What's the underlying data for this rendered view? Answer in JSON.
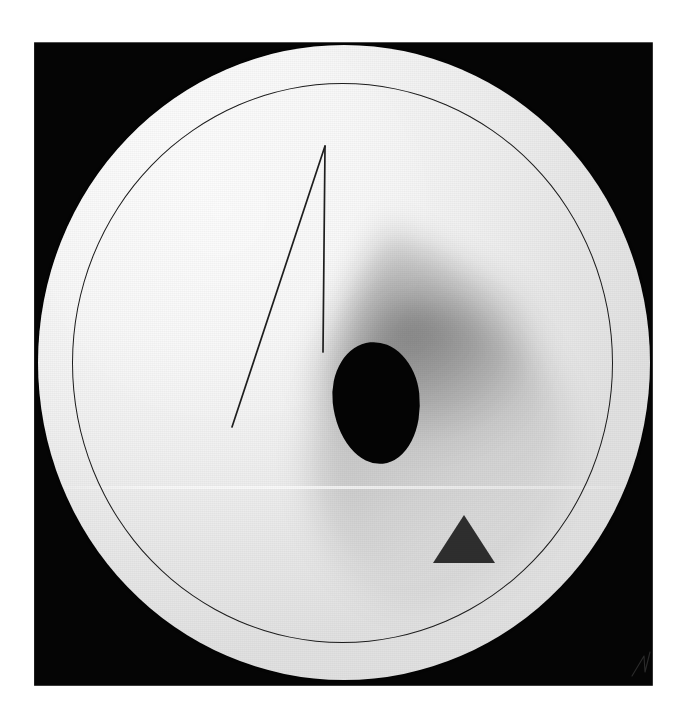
{
  "artwork": {
    "title": "Abstract geometric composition on white disc",
    "medium_description": "Photograph of a circular white panel mounted on a black square plate",
    "canvas": {
      "width": 687,
      "height": 719,
      "background_color": "#ffffff"
    },
    "plate": {
      "name": "black square plate",
      "color": "#050505",
      "left": 34,
      "top": 42,
      "width": 619,
      "height": 644
    },
    "disc": {
      "name": "white circular panel",
      "color_light": "#fbfbfb",
      "color_shade": "#e1e1e1",
      "center_x": 344,
      "center_y": 362,
      "radius_x": 306,
      "radius_y": 317
    },
    "inner_ring": {
      "name": "thin inscribed circle",
      "stroke_color": "#1c1c1c",
      "stroke_width": 1.4,
      "center_x": 344,
      "center_y": 361,
      "radius_x": 270,
      "radius_y": 280
    },
    "center_ellipse": {
      "name": "black ellipse",
      "color": "#040404",
      "center_x": 338,
      "center_y": 358,
      "width": 87,
      "height": 122,
      "rotation_deg": -6
    },
    "triangle": {
      "name": "dark grey triangle",
      "color": "#2e2e2e",
      "apex_x": 426,
      "apex_y": 470,
      "base_left_x": 395,
      "base_right_x": 457,
      "base_y": 518
    },
    "line_figure": {
      "name": "thin lambda stroke",
      "stroke_color": "#1e1e1e",
      "stroke_width": 1.7,
      "apex_x": 325,
      "apex_y": 146,
      "vertical_end_x": 323,
      "vertical_end_y": 352,
      "diagonal_end_x": 232,
      "diagonal_end_y": 427
    },
    "cast_shadow": {
      "name": "soft cast shadow",
      "direction": "down-right",
      "max_opacity": 0.34
    },
    "signature_mark": {
      "name": "faint signature scratch",
      "position_x": 628,
      "position_y": 646,
      "opacity": 0.55
    }
  }
}
